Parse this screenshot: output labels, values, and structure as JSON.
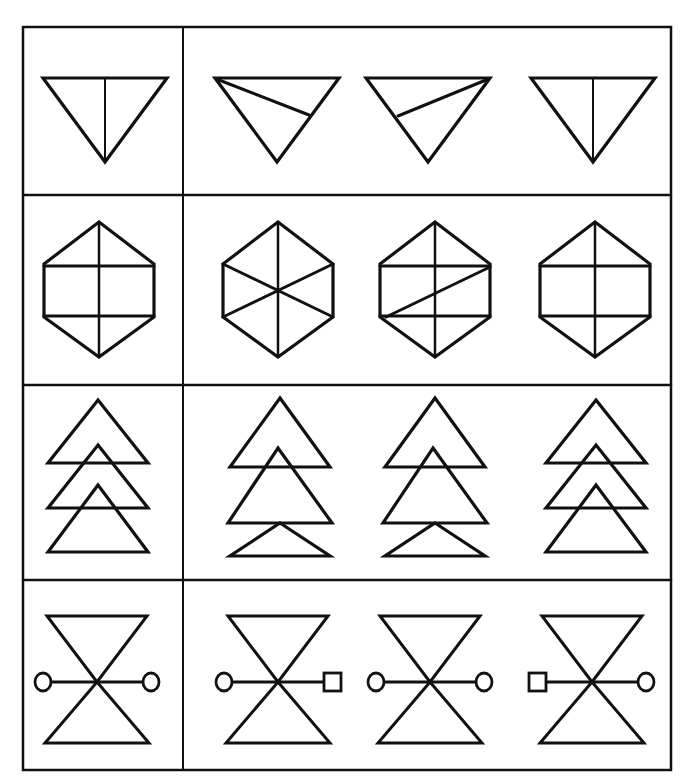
{
  "puzzle": {
    "type": "figure-matching",
    "instruction_visible": false,
    "stroke_color": "#111111",
    "background": "#ffffff",
    "grid": {
      "x": [
        23,
        183,
        671
      ],
      "y": [
        27,
        195,
        385,
        580,
        770
      ]
    },
    "rows": [
      {
        "id": "row-1",
        "name": "inverted-triangle",
        "target": {
          "cx": 105,
          "shape": "tri-down-vertical"
        },
        "options": [
          {
            "label": "A",
            "cx": 277,
            "shape": "tri-down-left-diag"
          },
          {
            "label": "B",
            "cx": 428,
            "shape": "tri-down-right-diag"
          },
          {
            "label": "C",
            "cx": 593,
            "shape": "tri-down-vertical"
          }
        ]
      },
      {
        "id": "row-2",
        "name": "hexagon",
        "target": {
          "cx": 99,
          "shape": "hex-cross"
        },
        "options": [
          {
            "label": "A",
            "cx": 278,
            "shape": "hex-star"
          },
          {
            "label": "B",
            "cx": 435,
            "shape": "hex-cross-diag"
          },
          {
            "label": "C",
            "cx": 595,
            "shape": "hex-cross"
          }
        ]
      },
      {
        "id": "row-3",
        "name": "stacked-triangles",
        "target": {
          "cx": 98,
          "shape": "tri-stack-equal"
        },
        "options": [
          {
            "label": "A",
            "cx": 280,
            "shape": "tri-stack-big-middle"
          },
          {
            "label": "B",
            "cx": 435,
            "shape": "tri-stack-big-middle-b"
          },
          {
            "label": "C",
            "cx": 596,
            "shape": "tri-stack-equal"
          }
        ]
      },
      {
        "id": "row-4",
        "name": "hourglass-with-bar",
        "target": {
          "cx": 97,
          "shape": "hourglass",
          "left": "circle",
          "right": "circle"
        },
        "options": [
          {
            "label": "A",
            "cx": 278,
            "shape": "hourglass",
            "left": "circle",
            "right": "square"
          },
          {
            "label": "B",
            "cx": 430,
            "shape": "hourglass",
            "left": "circle",
            "right": "circle"
          },
          {
            "label": "C",
            "cx": 592,
            "shape": "hourglass",
            "left": "square",
            "right": "circle"
          }
        ]
      }
    ]
  }
}
